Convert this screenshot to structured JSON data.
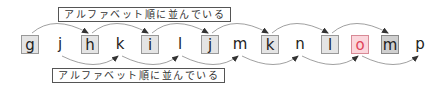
{
  "diagram": {
    "top_label": "アルファベット順に並んでいる",
    "bottom_label": "アルファベット順に並んでいる",
    "letters": [
      {
        "char": "g",
        "x": 30,
        "style": "boxed"
      },
      {
        "char": "j",
        "x": 60,
        "style": "plain"
      },
      {
        "char": "h",
        "x": 90,
        "style": "boxed"
      },
      {
        "char": "k",
        "x": 120,
        "style": "plain"
      },
      {
        "char": "i",
        "x": 150,
        "style": "boxed"
      },
      {
        "char": "l",
        "x": 180,
        "style": "plain"
      },
      {
        "char": "j",
        "x": 210,
        "style": "boxed"
      },
      {
        "char": "m",
        "x": 240,
        "style": "plain"
      },
      {
        "char": "k",
        "x": 270,
        "style": "boxed"
      },
      {
        "char": "n",
        "x": 300,
        "style": "plain"
      },
      {
        "char": "l",
        "x": 330,
        "style": "boxed"
      },
      {
        "char": "o",
        "x": 360,
        "style": "highlight"
      },
      {
        "char": "m",
        "x": 390,
        "style": "dark"
      },
      {
        "char": "p",
        "x": 420,
        "style": "plain"
      }
    ],
    "top_arcs": [
      [
        30,
        90
      ],
      [
        90,
        150
      ],
      [
        150,
        210
      ],
      [
        210,
        270
      ],
      [
        270,
        330
      ],
      [
        330,
        390
      ]
    ],
    "bottom_arcs": [
      [
        60,
        120
      ],
      [
        120,
        180
      ],
      [
        180,
        240
      ],
      [
        240,
        300
      ],
      [
        300,
        360
      ],
      [
        360,
        420
      ]
    ],
    "colors": {
      "box_fill": "#e4e4e4",
      "box_border": "#999999",
      "highlight_fill": "#fbd6dc",
      "highlight_text": "#e0455a",
      "dark_fill": "#cfcfcf",
      "arc": "#888888",
      "arrowhead": "#333333"
    }
  }
}
